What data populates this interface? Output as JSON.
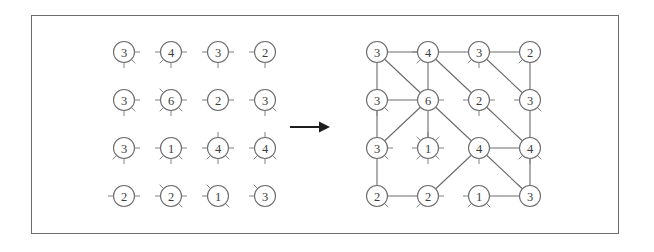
{
  "figure": {
    "frame": {
      "x": 31,
      "y": 15,
      "width": 588,
      "height": 219,
      "border_color": "#6d6d6d"
    },
    "colors": {
      "background": "#ffffff",
      "node_stroke": "#6b6b6b",
      "node_fill": "#ffffff",
      "label_text": "#3a3a3a",
      "stub_stroke": "#808080",
      "edge_stroke": "#6b6b6b",
      "arrow": "#1d1d1d"
    },
    "node_radius": 10.5,
    "stub_length": 5.5
  },
  "arrow": {
    "name": "transformation-arrow",
    "symbol": "→",
    "x1": 290,
    "y1": 127,
    "x2": 330,
    "y2": 127
  },
  "left_panel": {
    "name": "stub-grid",
    "caption": "",
    "origin_x": 124,
    "origin_y": 52,
    "step_x": 47,
    "step_y": 48,
    "rows": 4,
    "cols": 4,
    "nodes": [
      {
        "row": 0,
        "col": 0,
        "value": 3,
        "stubs": [
          0,
          45,
          90
        ]
      },
      {
        "row": 0,
        "col": 1,
        "value": 4,
        "stubs": [
          0,
          90,
          135,
          180
        ]
      },
      {
        "row": 0,
        "col": 2,
        "value": 3,
        "stubs": [
          0,
          90,
          180
        ]
      },
      {
        "row": 0,
        "col": 3,
        "value": 2,
        "stubs": [
          90,
          180
        ]
      },
      {
        "row": 1,
        "col": 0,
        "value": 3,
        "stubs": [
          0,
          45,
          90
        ]
      },
      {
        "row": 1,
        "col": 1,
        "value": 6,
        "stubs": [
          0,
          45,
          90,
          135,
          180,
          225
        ]
      },
      {
        "row": 1,
        "col": 2,
        "value": 2,
        "stubs": [
          0,
          180
        ]
      },
      {
        "row": 1,
        "col": 3,
        "value": 3,
        "stubs": [
          45,
          90,
          180
        ]
      },
      {
        "row": 2,
        "col": 0,
        "value": 3,
        "stubs": [
          0,
          90,
          135
        ]
      },
      {
        "row": 2,
        "col": 1,
        "value": 1,
        "stubs": [
          0,
          45,
          90,
          135,
          180
        ]
      },
      {
        "row": 2,
        "col": 2,
        "value": 4,
        "stubs": [
          0,
          45,
          90,
          135,
          180,
          270
        ]
      },
      {
        "row": 2,
        "col": 3,
        "value": 4,
        "stubs": [
          45,
          90,
          135,
          180,
          270
        ]
      },
      {
        "row": 3,
        "col": 0,
        "value": 2,
        "stubs": [
          0,
          180
        ]
      },
      {
        "row": 3,
        "col": 1,
        "value": 2,
        "stubs": [
          0,
          45,
          180,
          225
        ]
      },
      {
        "row": 3,
        "col": 2,
        "value": 1,
        "stubs": [
          45,
          180,
          225
        ]
      },
      {
        "row": 3,
        "col": 3,
        "value": 3,
        "stubs": [
          180,
          225
        ]
      }
    ]
  },
  "right_panel": {
    "name": "connected-graph",
    "caption": "",
    "origin_x": 377,
    "origin_y": 52,
    "step_x": 51,
    "step_y": 48,
    "rows": 4,
    "cols": 4,
    "nodes": [
      {
        "row": 0,
        "col": 0,
        "value": 3,
        "stubs": []
      },
      {
        "row": 0,
        "col": 1,
        "value": 4,
        "stubs": [
          135,
          180
        ]
      },
      {
        "row": 0,
        "col": 2,
        "value": 3,
        "stubs": [
          90,
          135
        ]
      },
      {
        "row": 0,
        "col": 3,
        "value": 2,
        "stubs": [
          135
        ]
      },
      {
        "row": 1,
        "col": 0,
        "value": 3,
        "stubs": [
          45,
          90
        ]
      },
      {
        "row": 1,
        "col": 1,
        "value": 6,
        "stubs": [
          0
        ]
      },
      {
        "row": 1,
        "col": 2,
        "value": 2,
        "stubs": [
          0,
          45,
          90,
          180
        ]
      },
      {
        "row": 1,
        "col": 3,
        "value": 3,
        "stubs": [
          45,
          180
        ]
      },
      {
        "row": 2,
        "col": 0,
        "value": 3,
        "stubs": [
          0,
          45
        ]
      },
      {
        "row": 2,
        "col": 1,
        "value": 1,
        "stubs": [
          0,
          45,
          90,
          135,
          180,
          225,
          270,
          315
        ]
      },
      {
        "row": 2,
        "col": 2,
        "value": 4,
        "stubs": [
          90
        ]
      },
      {
        "row": 2,
        "col": 3,
        "value": 4,
        "stubs": [
          45,
          90,
          135
        ]
      },
      {
        "row": 3,
        "col": 0,
        "value": 2,
        "stubs": [
          45
        ]
      },
      {
        "row": 3,
        "col": 1,
        "value": 2,
        "stubs": [
          0,
          135
        ]
      },
      {
        "row": 3,
        "col": 2,
        "value": 1,
        "stubs": [
          45,
          135,
          180
        ]
      },
      {
        "row": 3,
        "col": 3,
        "value": 3,
        "stubs": [
          225
        ]
      }
    ],
    "edges": [
      {
        "from": [
          0,
          0
        ],
        "to": [
          0,
          1
        ]
      },
      {
        "from": [
          0,
          0
        ],
        "to": [
          1,
          0
        ]
      },
      {
        "from": [
          0,
          0
        ],
        "to": [
          1,
          1
        ]
      },
      {
        "from": [
          0,
          1
        ],
        "to": [
          0,
          2
        ]
      },
      {
        "from": [
          0,
          1
        ],
        "to": [
          1,
          1
        ]
      },
      {
        "from": [
          0,
          1
        ],
        "to": [
          1,
          2
        ]
      },
      {
        "from": [
          0,
          2
        ],
        "to": [
          0,
          3
        ]
      },
      {
        "from": [
          0,
          2
        ],
        "to": [
          1,
          3
        ]
      },
      {
        "from": [
          0,
          3
        ],
        "to": [
          1,
          3
        ]
      },
      {
        "from": [
          1,
          0
        ],
        "to": [
          1,
          1
        ]
      },
      {
        "from": [
          1,
          0
        ],
        "to": [
          2,
          0
        ]
      },
      {
        "from": [
          1,
          1
        ],
        "to": [
          2,
          0
        ]
      },
      {
        "from": [
          1,
          1
        ],
        "to": [
          2,
          1
        ]
      },
      {
        "from": [
          1,
          1
        ],
        "to": [
          2,
          2
        ]
      },
      {
        "from": [
          1,
          2
        ],
        "to": [
          2,
          3
        ]
      },
      {
        "from": [
          1,
          3
        ],
        "to": [
          2,
          3
        ]
      },
      {
        "from": [
          2,
          0
        ],
        "to": [
          3,
          0
        ]
      },
      {
        "from": [
          2,
          2
        ],
        "to": [
          2,
          3
        ]
      },
      {
        "from": [
          2,
          2
        ],
        "to": [
          3,
          1
        ]
      },
      {
        "from": [
          2,
          2
        ],
        "to": [
          3,
          3
        ]
      },
      {
        "from": [
          2,
          3
        ],
        "to": [
          3,
          3
        ]
      },
      {
        "from": [
          3,
          0
        ],
        "to": [
          3,
          1
        ]
      },
      {
        "from": [
          3,
          2
        ],
        "to": [
          3,
          3
        ]
      }
    ]
  }
}
